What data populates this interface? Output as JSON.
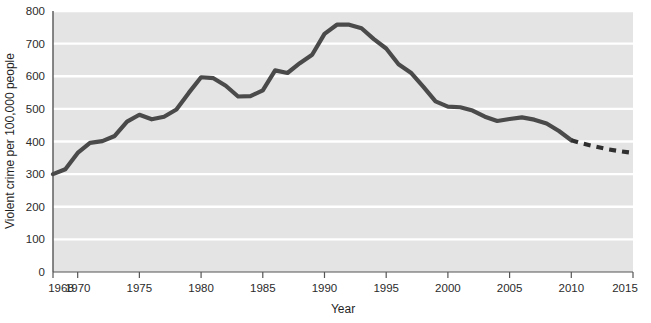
{
  "chart_data": {
    "type": "line",
    "title": "",
    "xlabel": "Year",
    "ylabel": "Violent crime per 100,000 people",
    "xlim": [
      1968,
      2015
    ],
    "ylim": [
      0,
      800
    ],
    "grid": true,
    "legend": "none",
    "xticks": [
      1968,
      1970,
      1975,
      1980,
      1985,
      1990,
      1995,
      2000,
      2005,
      2010,
      2015
    ],
    "xtick_labels": [
      "1968",
      "1970",
      "1975",
      "1980",
      "1985",
      "1990",
      "1995",
      "2000",
      "2005",
      "2010",
      "2015"
    ],
    "yticks": [
      0,
      100,
      200,
      300,
      400,
      500,
      600,
      700,
      800
    ],
    "ytick_labels": [
      "0",
      "100",
      "200",
      "300",
      "400",
      "500",
      "600",
      "700",
      "800"
    ],
    "series": [
      {
        "name": "Violent crime rate (reported)",
        "style": "solid",
        "color": "#4a4a4a",
        "x": [
          1968,
          1969,
          1970,
          1971,
          1972,
          1973,
          1974,
          1975,
          1976,
          1977,
          1978,
          1979,
          1980,
          1981,
          1982,
          1983,
          1984,
          1985,
          1986,
          1987,
          1988,
          1989,
          1990,
          1991,
          1992,
          1993,
          1994,
          1995,
          1996,
          1997,
          1998,
          1999,
          2000,
          2001,
          2002,
          2003,
          2004,
          2005,
          2006,
          2007,
          2008,
          2009,
          2010
        ],
        "values": [
          300,
          315,
          365,
          396,
          401,
          417,
          461,
          482,
          468,
          476,
          498,
          549,
          597,
          594,
          571,
          538,
          539,
          557,
          618,
          610,
          640,
          666,
          730,
          758,
          758,
          747,
          714,
          685,
          637,
          611,
          568,
          523,
          507,
          505,
          495,
          476,
          463,
          469,
          474,
          467,
          455,
          432,
          404
        ]
      },
      {
        "name": "Projected trend",
        "style": "dashed",
        "color": "#303030",
        "x": [
          2010,
          2011,
          2012,
          2013,
          2014,
          2015
        ],
        "values": [
          404,
          393,
          384,
          376,
          370,
          365
        ]
      }
    ],
    "annotations": []
  },
  "style": {
    "plot_background": "#e4e4e4",
    "gridline_color": "#ffffff",
    "axis_color": "#555555",
    "line_color": "#4a4a4a",
    "page_background": "#ffffff"
  }
}
